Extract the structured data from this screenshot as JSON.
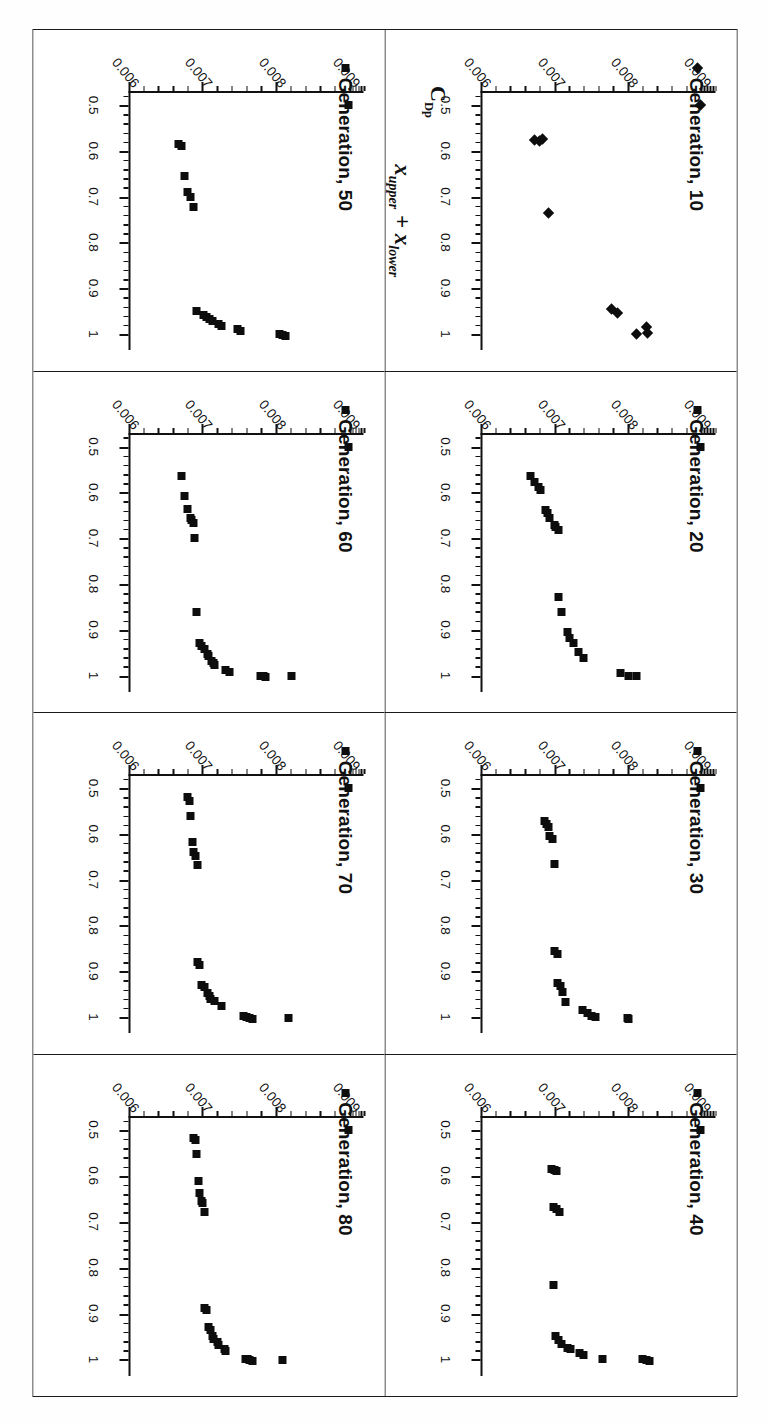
{
  "figure": {
    "kind": "scanned-journal-figure",
    "orientation_note": "rotated-90-cw",
    "rows": 2,
    "cols": 4
  },
  "axis": {
    "x_title_lead": "x",
    "x_title_sub1": "upper",
    "x_title_plus": "+",
    "x_title_lead2": "x",
    "x_title_sub2": "lower",
    "y_title_lead": "C",
    "y_title_sub": "Dp",
    "x_ticks": [
      "0.5",
      "0.6",
      "0.7",
      "0.8",
      "0.9",
      "1"
    ],
    "y_ticks": [
      "0.006",
      "0.007",
      "0.008",
      "0.009"
    ],
    "xlim": [
      0.47,
      1.035
    ],
    "ylim": [
      0.006,
      0.0092
    ],
    "x_minor_per_major": 5,
    "y_minor_per_major": 5
  },
  "chart_data": {
    "type": "scatter",
    "title": "",
    "xlabel": "x_upper + x_lower",
    "ylabel": "C_Dp",
    "xlim": [
      0.47,
      1.035
    ],
    "ylim": [
      0.006,
      0.0092
    ],
    "grid": false,
    "legend": "none",
    "panels": [
      {
        "label": "Generation, 10",
        "marker": "diamond",
        "points": [
          [
            0.5,
            0.00899
          ],
          [
            0.575,
            0.00685
          ],
          [
            0.578,
            0.0068
          ],
          [
            0.576,
            0.00674
          ],
          [
            0.735,
            0.00692
          ],
          [
            0.945,
            0.00778
          ],
          [
            0.955,
            0.00787
          ],
          [
            0.985,
            0.00826
          ],
          [
            0.998,
            0.00828
          ],
          [
            1.0,
            0.00813
          ]
        ]
      },
      {
        "label": "Generation, 20",
        "marker": "square",
        "points": [
          [
            0.5,
            0.00899
          ],
          [
            0.565,
            0.00668
          ],
          [
            0.578,
            0.00673
          ],
          [
            0.588,
            0.00679
          ],
          [
            0.595,
            0.00681
          ],
          [
            0.638,
            0.00689
          ],
          [
            0.645,
            0.00691
          ],
          [
            0.655,
            0.00694
          ],
          [
            0.672,
            0.007
          ],
          [
            0.676,
            0.00702
          ],
          [
            0.682,
            0.00706
          ],
          [
            0.828,
            0.00706
          ],
          [
            0.862,
            0.0071
          ],
          [
            0.905,
            0.00718
          ],
          [
            0.918,
            0.00721
          ],
          [
            0.928,
            0.00726
          ],
          [
            0.948,
            0.00733
          ],
          [
            0.962,
            0.0074
          ],
          [
            0.995,
            0.0079
          ],
          [
            1.0,
            0.00802
          ],
          [
            1.002,
            0.00812
          ]
        ]
      },
      {
        "label": "Generation, 30",
        "marker": "square",
        "points": [
          [
            0.5,
            0.00899
          ],
          [
            0.572,
            0.00687
          ],
          [
            0.578,
            0.0069
          ],
          [
            0.586,
            0.00692
          ],
          [
            0.605,
            0.00694
          ],
          [
            0.612,
            0.00698
          ],
          [
            0.665,
            0.00701
          ],
          [
            0.855,
            0.00701
          ],
          [
            0.862,
            0.00705
          ],
          [
            0.925,
            0.00705
          ],
          [
            0.932,
            0.00709
          ],
          [
            0.945,
            0.00712
          ],
          [
            0.968,
            0.00716
          ],
          [
            0.985,
            0.00739
          ],
          [
            0.992,
            0.00745
          ],
          [
            0.998,
            0.00751
          ],
          [
            1.0,
            0.00756
          ],
          [
            1.002,
            0.008
          ],
          [
            1.004,
            0.00802
          ]
        ]
      },
      {
        "label": "Generation, 40",
        "marker": "square",
        "points": [
          [
            0.5,
            0.00899
          ],
          [
            0.585,
            0.00696
          ],
          [
            0.588,
            0.007
          ],
          [
            0.59,
            0.00704
          ],
          [
            0.668,
            0.00699
          ],
          [
            0.672,
            0.00703
          ],
          [
            0.678,
            0.00707
          ],
          [
            0.838,
            0.00699
          ],
          [
            0.948,
            0.00702
          ],
          [
            0.958,
            0.00706
          ],
          [
            0.966,
            0.0071
          ],
          [
            0.975,
            0.00718
          ],
          [
            0.978,
            0.00722
          ],
          [
            0.985,
            0.00735
          ],
          [
            0.99,
            0.0074
          ],
          [
            0.998,
            0.00766
          ],
          [
            1.0,
            0.0082
          ],
          [
            1.002,
            0.00826
          ],
          [
            1.004,
            0.0083
          ]
        ]
      },
      {
        "label": "Generation, 50",
        "marker": "square",
        "points": [
          [
            0.5,
            0.00899
          ],
          [
            0.585,
            0.00668
          ],
          [
            0.59,
            0.00672
          ],
          [
            0.656,
            0.00676
          ],
          [
            0.69,
            0.0068
          ],
          [
            0.7,
            0.00684
          ],
          [
            0.722,
            0.00688
          ],
          [
            0.95,
            0.00692
          ],
          [
            0.958,
            0.00702
          ],
          [
            0.962,
            0.00706
          ],
          [
            0.968,
            0.0071
          ],
          [
            0.972,
            0.00714
          ],
          [
            0.978,
            0.00722
          ],
          [
            0.982,
            0.00726
          ],
          [
            0.988,
            0.00748
          ],
          [
            0.994,
            0.00752
          ],
          [
            1.0,
            0.00806
          ],
          [
            1.002,
            0.0081
          ],
          [
            1.004,
            0.00814
          ]
        ]
      },
      {
        "label": "Generation, 60",
        "marker": "square",
        "points": [
          [
            0.5,
            0.00899
          ],
          [
            0.565,
            0.00672
          ],
          [
            0.608,
            0.00676
          ],
          [
            0.637,
            0.0068
          ],
          [
            0.655,
            0.00684
          ],
          [
            0.661,
            0.00686
          ],
          [
            0.668,
            0.00688
          ],
          [
            0.7,
            0.0069
          ],
          [
            0.862,
            0.00692
          ],
          [
            0.93,
            0.00697
          ],
          [
            0.935,
            0.00699
          ],
          [
            0.942,
            0.00703
          ],
          [
            0.952,
            0.00707
          ],
          [
            0.958,
            0.00709
          ],
          [
            0.968,
            0.00713
          ],
          [
            0.972,
            0.00715
          ],
          [
            0.976,
            0.00717
          ],
          [
            0.988,
            0.00732
          ],
          [
            0.992,
            0.00737
          ],
          [
            1.0,
            0.0078
          ],
          [
            1.002,
            0.00784
          ],
          [
            1.004,
            0.00786
          ],
          [
            1.002,
            0.00822
          ]
        ]
      },
      {
        "label": "Generation, 70",
        "marker": "square",
        "points": [
          [
            0.5,
            0.00899
          ],
          [
            0.52,
            0.00681
          ],
          [
            0.528,
            0.00683
          ],
          [
            0.562,
            0.00685
          ],
          [
            0.618,
            0.00687
          ],
          [
            0.64,
            0.00689
          ],
          [
            0.648,
            0.00691
          ],
          [
            0.668,
            0.00694
          ],
          [
            0.88,
            0.00694
          ],
          [
            0.886,
            0.00697
          ],
          [
            0.93,
            0.007
          ],
          [
            0.935,
            0.00703
          ],
          [
            0.948,
            0.00707
          ],
          [
            0.955,
            0.0071
          ],
          [
            0.96,
            0.00712
          ],
          [
            0.966,
            0.00717
          ],
          [
            0.975,
            0.00727
          ],
          [
            0.998,
            0.00757
          ],
          [
            1.0,
            0.00761
          ],
          [
            1.002,
            0.00765
          ],
          [
            1.004,
            0.00768
          ],
          [
            1.002,
            0.00818
          ]
        ]
      },
      {
        "label": "Generation, 80",
        "marker": "square",
        "points": [
          [
            0.5,
            0.00899
          ],
          [
            0.518,
            0.00689
          ],
          [
            0.523,
            0.00691
          ],
          [
            0.552,
            0.00693
          ],
          [
            0.612,
            0.00695
          ],
          [
            0.638,
            0.00697
          ],
          [
            0.655,
            0.00699
          ],
          [
            0.66,
            0.00701
          ],
          [
            0.68,
            0.00703
          ],
          [
            0.888,
            0.00703
          ],
          [
            0.893,
            0.00706
          ],
          [
            0.93,
            0.00709
          ],
          [
            0.936,
            0.00711
          ],
          [
            0.948,
            0.00714
          ],
          [
            0.955,
            0.00716
          ],
          [
            0.962,
            0.00721
          ],
          [
            0.968,
            0.00723
          ],
          [
            0.978,
            0.0073
          ],
          [
            0.982,
            0.00732
          ],
          [
            0.998,
            0.00759
          ],
          [
            1.0,
            0.00762
          ],
          [
            1.002,
            0.00765
          ],
          [
            1.004,
            0.00768
          ],
          [
            1.002,
            0.0081
          ]
        ]
      }
    ],
    "panel_order_in_grid": [
      "Generation, 10",
      "Generation, 20",
      "Generation, 30",
      "Generation, 40",
      "Generation, 50",
      "Generation, 60",
      "Generation, 70",
      "Generation, 80"
    ]
  }
}
